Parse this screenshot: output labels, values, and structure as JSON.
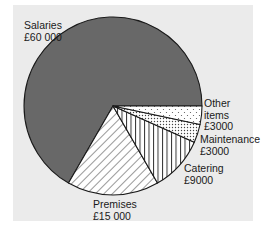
{
  "chart_data": {
    "type": "pie",
    "title": "",
    "currency": "£",
    "total": 90000,
    "start_angle_deg": 0,
    "direction": "counterclockwise",
    "slices": [
      {
        "name": "Salaries",
        "value": 60000,
        "value_label": "£60 000",
        "fill": "#686868",
        "pattern": "solid"
      },
      {
        "name": "Premises",
        "value": 15000,
        "value_label": "£15 000",
        "fill": "#ffffff",
        "pattern": "diagonal-lines"
      },
      {
        "name": "Catering",
        "value": 9000,
        "value_label": "£9000",
        "fill": "#ffffff",
        "pattern": "vertical-lines"
      },
      {
        "name": "Maintenance",
        "value": 3000,
        "value_label": "£3000",
        "fill": "#ffffff",
        "pattern": "dense-dots"
      },
      {
        "name": "Other items",
        "value": 3000,
        "value_label": "£3000",
        "fill": "#ffffff",
        "pattern": "sparse-dots"
      }
    ],
    "categories": [
      "Salaries",
      "Premises",
      "Catering",
      "Maintenance",
      "Other items"
    ],
    "values": [
      60000,
      15000,
      9000,
      3000,
      3000
    ],
    "legend": "none (direct labels)"
  },
  "labels": {
    "salaries": {
      "line1": "Salaries",
      "line2": "£60 000"
    },
    "premises": {
      "line1": "Premises",
      "line2": "£15 000"
    },
    "catering": {
      "line1": "Catering",
      "line2": "£9000"
    },
    "maintenance": {
      "line1": "Maintenance",
      "line2": "£3000"
    },
    "other": {
      "line1": "Other",
      "line2": "items",
      "line3": "£3000"
    }
  },
  "colors": {
    "panel_background": "#ebebeb",
    "page_background": "#ffffff",
    "outline": "#1a1a1a"
  }
}
